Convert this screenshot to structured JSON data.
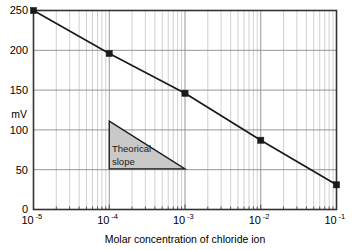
{
  "chart_data": {
    "type": "line",
    "title": "",
    "xlabel": "Molar concentration of chloride ion",
    "ylabel": "mV",
    "xscale": "log",
    "yscale": "linear",
    "xlim": [
      1e-05,
      0.1
    ],
    "ylim": [
      0,
      250
    ],
    "grid": true,
    "legend": "none",
    "x": [
      1e-05,
      0.0001,
      0.001,
      0.01,
      0.1
    ],
    "values": [
      250,
      196,
      146,
      87,
      31
    ],
    "series": [
      {
        "name": "Electrode response",
        "x": [
          1e-05,
          0.0001,
          0.001,
          0.01,
          0.1
        ],
        "values": [
          250,
          196,
          146,
          87,
          31
        ],
        "marker": "square",
        "marker_color": "#1a1a1a",
        "line_color": "#1a1a1a"
      }
    ],
    "xticks": [
      {
        "value": 1e-05,
        "base": "10",
        "exponent": "-5",
        "label": "10-5"
      },
      {
        "value": 0.0001,
        "base": "10",
        "exponent": "-4",
        "label": "10-4"
      },
      {
        "value": 0.001,
        "base": "10",
        "exponent": "-3",
        "label": "10-3"
      },
      {
        "value": 0.01,
        "base": "10",
        "exponent": "-2",
        "label": "10-2"
      },
      {
        "value": 0.1,
        "base": "10",
        "exponent": "-1",
        "label": "10-1"
      }
    ],
    "yticks": [
      {
        "value": 0,
        "label": "0"
      },
      {
        "value": 50,
        "label": "50"
      },
      {
        "value": 100,
        "label": "100"
      },
      {
        "value": 150,
        "label": "150"
      },
      {
        "value": 200,
        "label": "200"
      },
      {
        "value": 250,
        "label": "250"
      }
    ],
    "annotations": [
      {
        "name": "theoretical-slope-triangle",
        "text_line1": "Theorical",
        "text_line2": "slope",
        "shape": "right-triangle",
        "fill": "#c9c9c9",
        "stroke": "#1a1a1a",
        "x_start": 0.0001,
        "x_end": 0.001,
        "y_top": 111,
        "y_bottom": 51
      }
    ],
    "colors": {
      "line": "#1a1a1a",
      "marker": "#1a1a1a",
      "axis": "#333333",
      "major_grid": "#8a8a8a",
      "minor_grid": "#bdbdbd",
      "annotation_fill": "#c9c9c9",
      "background": "#ffffff"
    }
  }
}
